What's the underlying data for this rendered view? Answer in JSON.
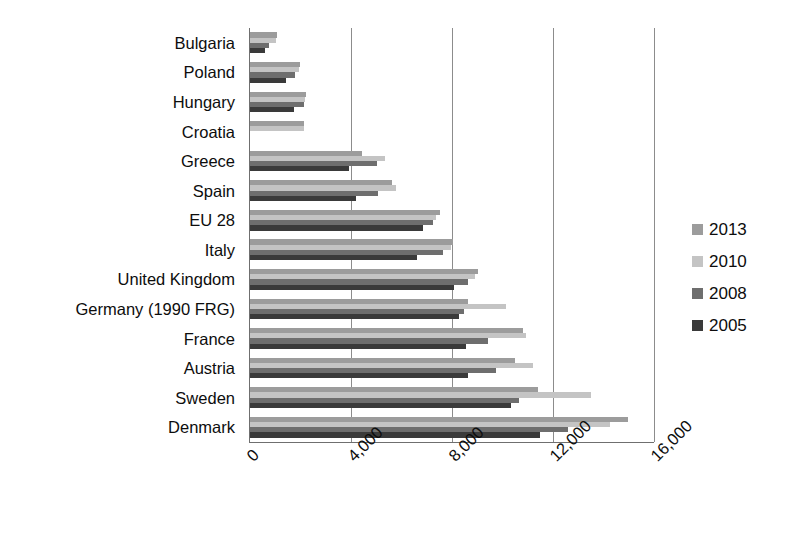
{
  "chart_data": {
    "type": "bar",
    "orientation": "horizontal",
    "title": "",
    "xlabel": "",
    "ylabel": "",
    "xlim": [
      0,
      16000
    ],
    "xticks": [
      "0",
      "4,000",
      "8,000",
      "12,000",
      "16,000"
    ],
    "xtick_values": [
      0,
      4000,
      8000,
      12000,
      16000
    ],
    "grid": "vertical",
    "legend_position": "right",
    "categories": [
      "Bulgaria",
      "Poland",
      "Hungary",
      "Croatia",
      "Greece",
      "Spain",
      "EU 28",
      "Italy",
      "United Kingdom",
      "Germany (1990 FRG)",
      "France",
      "Austria",
      "Sweden",
      "Denmark"
    ],
    "series": [
      {
        "name": "2013",
        "color": "#9c9c9c",
        "values": [
          1070,
          1985,
          2200,
          2150,
          4450,
          5640,
          7540,
          8020,
          9010,
          8615,
          10800,
          10480,
          11390,
          14970
        ]
      },
      {
        "name": "2010",
        "color": "#c4c4c4",
        "values": [
          1030,
          1945,
          2180,
          2150,
          5360,
          5770,
          7360,
          7980,
          8900,
          10125,
          10920,
          11190,
          13500,
          14250
        ]
      },
      {
        "name": "2008",
        "color": "#6e6e6e",
        "values": [
          755,
          1790,
          2150,
          0,
          5040,
          5060,
          7230,
          7660,
          8650,
          8460,
          9420,
          9730,
          10660,
          12580
        ]
      },
      {
        "name": "2005",
        "color": "#3a3a3a",
        "values": [
          600,
          1415,
          1740,
          0,
          3930,
          4200,
          6870,
          6630,
          8070,
          8260,
          8560,
          8620,
          10350,
          11490
        ]
      }
    ]
  },
  "legend": {
    "items": [
      {
        "label": "2013",
        "color": "#9c9c9c"
      },
      {
        "label": "2010",
        "color": "#c4c4c4"
      },
      {
        "label": "2008",
        "color": "#6e6e6e"
      },
      {
        "label": "2005",
        "color": "#3a3a3a"
      }
    ]
  }
}
